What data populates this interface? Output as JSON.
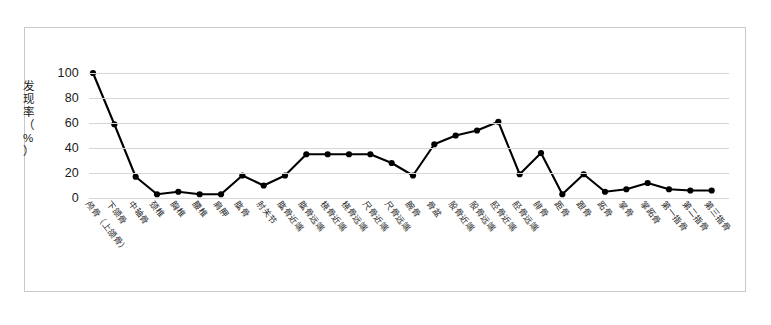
{
  "chart_data": {
    "type": "line",
    "title": "",
    "xlabel": "",
    "ylabel": "发现率（%）",
    "ylim": [
      0,
      100
    ],
    "yticks": [
      0,
      20,
      40,
      60,
      80,
      100
    ],
    "grid": true,
    "legend": "none",
    "marker": "filled-circle",
    "line_color": "#000000",
    "grid_color": "#d7d7d7",
    "border_color": "#c9c9c9",
    "categories": [
      "颅骨（上颌骨）",
      "下颌骨",
      "中轴骨",
      "颈椎",
      "胸椎",
      "腰椎",
      "肩胛",
      "肱骨",
      "肘关节",
      "肱骨近端",
      "肱骨远端",
      "桡骨近端",
      "桡骨远端",
      "尺骨近端",
      "尺骨远端",
      "腕骨",
      "骨盆",
      "股骨近端",
      "股骨远端",
      "胫骨近端",
      "胫骨远端",
      "腓骨",
      "距骨",
      "跟骨",
      "跖骨",
      "掌骨",
      "掌跖骨",
      "第一指骨",
      "第二指骨",
      "第三指骨"
    ],
    "values": [
      100,
      59,
      17,
      3,
      5,
      3,
      3,
      18,
      10,
      18,
      35,
      35,
      35,
      35,
      28,
      18,
      43,
      50,
      54,
      61,
      19,
      36,
      3,
      19,
      5,
      7,
      12,
      7,
      6,
      6
    ],
    "series": [
      {
        "name": "发现率",
        "values": [
          100,
          59,
          17,
          3,
          5,
          3,
          3,
          18,
          10,
          18,
          35,
          35,
          35,
          35,
          28,
          18,
          43,
          50,
          54,
          61,
          19,
          36,
          3,
          19,
          5,
          7,
          12,
          7,
          6,
          6
        ]
      }
    ]
  }
}
